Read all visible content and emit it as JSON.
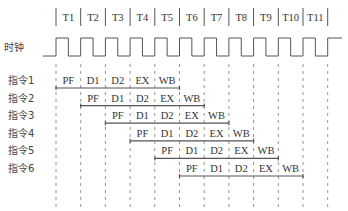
{
  "diagram": {
    "title": "",
    "clock_label": "时钟",
    "periods": [
      "T1",
      "T2",
      "T3",
      "T4",
      "T5",
      "T6",
      "T7",
      "T8",
      "T9",
      "T10",
      "T11"
    ],
    "stages": [
      "PF",
      "D1",
      "D2",
      "EX",
      "WB"
    ],
    "instructions": [
      {
        "label": "指令1",
        "start_period": 1
      },
      {
        "label": "指令2",
        "start_period": 2
      },
      {
        "label": "指令3",
        "start_period": 3
      },
      {
        "label": "指令4",
        "start_period": 4
      },
      {
        "label": "指令5",
        "start_period": 5
      },
      {
        "label": "指令6",
        "start_period": 6
      }
    ],
    "colors": {
      "line": "#555555",
      "text": "#333333",
      "dash": "#777777"
    }
  }
}
